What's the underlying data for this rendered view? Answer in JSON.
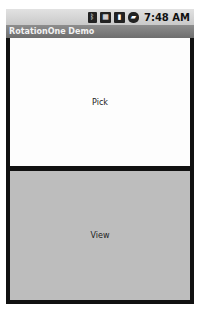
{
  "status_bar": {
    "icons": [
      "bluetooth-icon",
      "network-3g-icon",
      "signal-icon",
      "battery-icon"
    ],
    "time": "7:48 AM"
  },
  "app": {
    "title": "RotationOne Demo"
  },
  "buttons": {
    "pick": "Pick",
    "view": "View"
  },
  "colors": {
    "title_bar": "#7a7a7a",
    "pick_bg": "#fdfdfd",
    "view_bg": "#bdbdbd",
    "frame": "#111111"
  }
}
